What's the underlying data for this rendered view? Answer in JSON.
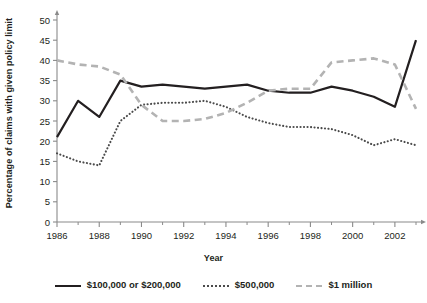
{
  "chart_data": {
    "type": "line",
    "title": "",
    "xlabel": "Year",
    "ylabel": "Percentage of claims with given policy limit",
    "xlim": [
      1986,
      2003
    ],
    "ylim": [
      0,
      50
    ],
    "ytick_step": 5,
    "yticks": [
      0,
      5,
      10,
      15,
      20,
      25,
      30,
      35,
      40,
      45,
      50
    ],
    "xticks": [
      1986,
      1988,
      1990,
      1992,
      1994,
      1996,
      1998,
      2000,
      2002
    ],
    "x_minor_ticks": [
      1987,
      1989,
      1991,
      1993,
      1995,
      1997,
      1999,
      2001,
      2003
    ],
    "x": [
      1986,
      1987,
      1988,
      1989,
      1990,
      1991,
      1992,
      1993,
      1994,
      1995,
      1996,
      1997,
      1998,
      1999,
      2000,
      2001,
      2002,
      2003
    ],
    "grid": false,
    "legend_position": "bottom",
    "series": [
      {
        "name": "$100,000 or $200,000",
        "style": "solid",
        "color": "#231f20",
        "values": [
          21,
          30,
          26,
          35,
          33.5,
          34,
          33.5,
          33,
          33.5,
          34,
          32.5,
          32,
          32,
          33.5,
          32.5,
          31,
          28.5,
          45
        ]
      },
      {
        "name": "$500,000",
        "style": "dotted",
        "color": "#4b4b4b",
        "values": [
          17,
          15,
          14,
          25,
          29,
          29.5,
          29.5,
          30,
          28.5,
          26,
          24.5,
          23.5,
          23.5,
          23,
          21.5,
          19,
          20.5,
          19
        ]
      },
      {
        "name": "$1 million",
        "style": "dashed",
        "color": "#b3b3b3",
        "values": [
          40,
          39,
          38.5,
          36.5,
          29,
          25,
          25,
          25.5,
          27,
          29.5,
          32.5,
          33,
          33,
          39.5,
          40,
          40.5,
          39,
          28
        ]
      }
    ]
  },
  "axis": {
    "ylabel": "Percentage of claims with given policy limit",
    "xlabel": "Year"
  },
  "legend": {
    "items": [
      {
        "label": "$100,000 or $200,000",
        "style": "solid"
      },
      {
        "label": "$500,000",
        "style": "dotted"
      },
      {
        "label": "$1 million",
        "style": "dashed"
      }
    ]
  },
  "colors": {
    "axis": "#8a8a8a",
    "text": "#231f20",
    "series_solid": "#231f20",
    "series_dotted": "#4b4b4b",
    "series_dashed": "#b3b3b3"
  }
}
